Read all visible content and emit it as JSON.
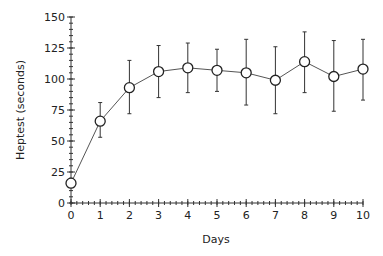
{
  "chart_data": {
    "type": "line",
    "title": "",
    "xlabel": "Days",
    "ylabel": "Heptest (seconds)",
    "xlim": [
      0,
      10
    ],
    "ylim": [
      0,
      150
    ],
    "x_ticks": [
      0,
      1,
      2,
      3,
      4,
      5,
      6,
      7,
      8,
      9,
      10
    ],
    "y_ticks": [
      0,
      25,
      50,
      75,
      100,
      125,
      150
    ],
    "x_minor_step": 0.2,
    "y_minor_step": 5,
    "grid": false,
    "legend": null,
    "series": [
      {
        "name": "Heptest",
        "marker": "open-circle",
        "x": [
          0,
          1,
          2,
          3,
          4,
          5,
          6,
          7,
          8,
          9,
          10
        ],
        "values": [
          16,
          66,
          93,
          106,
          109,
          107,
          105,
          99,
          114,
          102,
          108
        ],
        "error_upper": [
          19,
          81,
          115,
          127,
          129,
          124,
          132,
          126,
          138,
          131,
          132
        ],
        "error_lower": [
          13,
          53,
          72,
          85,
          89,
          90,
          79,
          72,
          89,
          74,
          83
        ]
      }
    ]
  }
}
